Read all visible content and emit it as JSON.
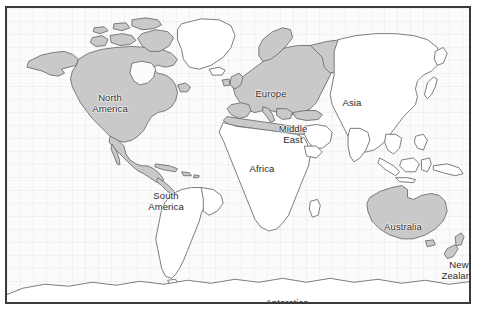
{
  "figure": {
    "kind": "world-map",
    "frame_color": "#3a3a3a",
    "ocean_color": "#fbfbfb",
    "land_color": "#ffffff",
    "land_outline_color": "#6e6e6e",
    "highlight_color": "#c9c9c9",
    "label_color": "#2b2b2b"
  },
  "labels": [
    {
      "id": "north-america",
      "text": "North\nAmerica",
      "x": 103,
      "y": 95,
      "highlighted": true
    },
    {
      "id": "south-america",
      "text": "South\nAmerica",
      "x": 159,
      "y": 193,
      "highlighted": false
    },
    {
      "id": "europe",
      "text": "Europe",
      "x": 264,
      "y": 85,
      "highlighted": true
    },
    {
      "id": "africa",
      "text": "Africa",
      "x": 255,
      "y": 160,
      "highlighted": false
    },
    {
      "id": "middle-east",
      "text": "Middle\nEast",
      "x": 286,
      "y": 126,
      "highlighted": false
    },
    {
      "id": "asia",
      "text": "Asia",
      "x": 345,
      "y": 94,
      "highlighted": false
    },
    {
      "id": "australia",
      "text": "Australia",
      "x": 396,
      "y": 218,
      "highlighted": true
    },
    {
      "id": "new-zealand",
      "text": "New\nZealand",
      "x": 452,
      "y": 262,
      "highlighted": true
    },
    {
      "id": "antarctica",
      "text": "Antarctica",
      "x": 280,
      "y": 294,
      "highlighted": false
    }
  ],
  "highlighted_regions": [
    "North America",
    "Europe",
    "Australia",
    "New Zealand"
  ],
  "plain_regions": [
    "Greenland",
    "South America",
    "Africa",
    "Middle East",
    "Asia",
    "Antarctica"
  ]
}
